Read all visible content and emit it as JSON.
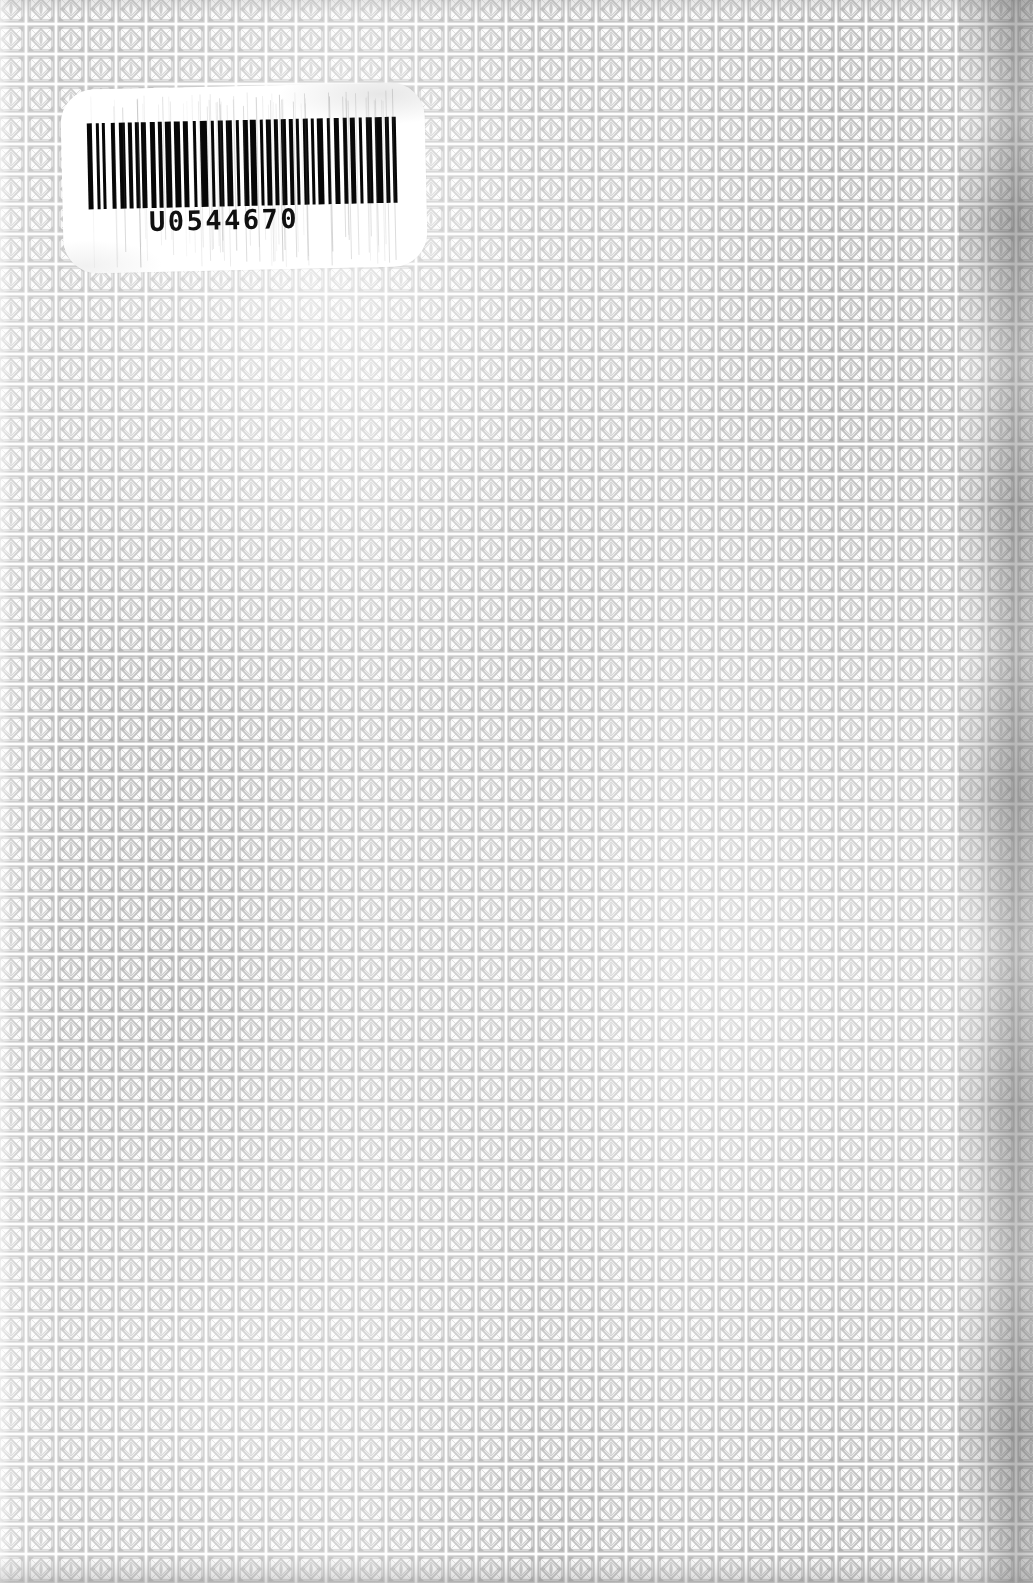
{
  "page": {
    "width": 1033,
    "height": 1583,
    "paper_color": "#fdfdfd"
  },
  "background_pattern": {
    "name": "diamond-lattice-tile",
    "motif": "square frame enclosing a diamond with corner florets and a central vertical lens",
    "tile_width": 30,
    "tile_height": 30,
    "ink_color": "#8d8d8d",
    "light_ink_color": "#bdbdbd",
    "paper_color": "#fdfdfd",
    "offset_x": -4,
    "offset_y": -6
  },
  "barcode_label": {
    "name": "library-barcode-label",
    "number": "U0544670",
    "symbology": "Codabar",
    "label_color": "#ffffff",
    "bar_color": "#070707",
    "corner_radius": 34,
    "rotation_deg": -1.25,
    "position": {
      "left": 62,
      "top": 86,
      "width": 364,
      "height": 184
    },
    "bar_widths": [
      6,
      4,
      4,
      4,
      3,
      7,
      4,
      5,
      7,
      4,
      4,
      4,
      4,
      3,
      6,
      4,
      6,
      4,
      4,
      4,
      7,
      3,
      7,
      4,
      6,
      5,
      4,
      4,
      9,
      4,
      4,
      4,
      6,
      4,
      7,
      4,
      4,
      4,
      6,
      3,
      7,
      4,
      4,
      3,
      6,
      4,
      4,
      4,
      6,
      3,
      4,
      4,
      4,
      4,
      6,
      4,
      3,
      4,
      7,
      4,
      4,
      4,
      6,
      5,
      4,
      4,
      6,
      4,
      4,
      4,
      7,
      4,
      8,
      4,
      4,
      4,
      4,
      3
    ]
  },
  "edges": {
    "right_gutter_shadow": true,
    "bottom_edge_shadow": true,
    "top_edge_shadow": true
  }
}
